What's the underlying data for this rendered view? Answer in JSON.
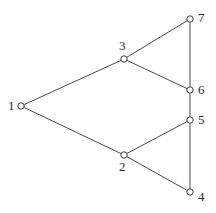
{
  "figure": {
    "name": "undirected-graph-diagram",
    "background_color": "#ffffff",
    "edge_color": "#4a4a4a",
    "node_fill_color": "#ffffff",
    "node_stroke_color": "#3c3c3c",
    "label_color": "#2b2b2b",
    "width": 216,
    "height": 213
  },
  "chart_data": {
    "type": "diagram",
    "title": "",
    "xlabel": "",
    "ylabel": "",
    "graph_kind": "undirected node-link graph",
    "node_count": 7,
    "edge_count": 9,
    "nodes": [
      {
        "id": "1",
        "label": "1",
        "x": 21,
        "y": 106,
        "label_x": 8,
        "label_y": 99,
        "label_pos": "left"
      },
      {
        "id": "2",
        "label": "2",
        "x": 124,
        "y": 155,
        "label_x": 119,
        "label_y": 160,
        "label_pos": "below"
      },
      {
        "id": "3",
        "label": "3",
        "x": 124,
        "y": 59,
        "label_x": 119,
        "label_y": 39,
        "label_pos": "above"
      },
      {
        "id": "4",
        "label": "4",
        "x": 190,
        "y": 192,
        "label_x": 198,
        "label_y": 190,
        "label_pos": "right"
      },
      {
        "id": "5",
        "label": "5",
        "x": 190,
        "y": 120,
        "label_x": 198,
        "label_y": 113,
        "label_pos": "right"
      },
      {
        "id": "6",
        "label": "6",
        "x": 190,
        "y": 90,
        "label_x": 198,
        "label_y": 83,
        "label_pos": "right"
      },
      {
        "id": "7",
        "label": "7",
        "x": 190,
        "y": 19,
        "label_x": 198,
        "label_y": 11,
        "label_pos": "right"
      }
    ],
    "edges": [
      {
        "source": "1",
        "target": "3"
      },
      {
        "source": "1",
        "target": "2"
      },
      {
        "source": "3",
        "target": "7"
      },
      {
        "source": "3",
        "target": "6"
      },
      {
        "source": "7",
        "target": "6"
      },
      {
        "source": "6",
        "target": "5"
      },
      {
        "source": "5",
        "target": "2"
      },
      {
        "source": "5",
        "target": "4"
      },
      {
        "source": "2",
        "target": "4"
      }
    ],
    "node_radius": 3.2,
    "legend": [],
    "annotations": []
  }
}
